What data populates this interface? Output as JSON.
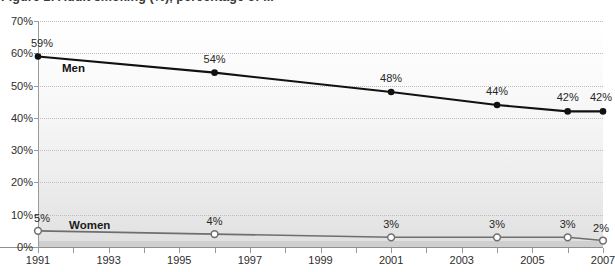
{
  "figure": {
    "title": "Figure 1: Adult smoking (%), percentage of ..."
  },
  "chart_data": {
    "type": "line",
    "title": "Figure 1: Adult smoking (%), percentage of ...",
    "xlabel": "",
    "ylabel": "",
    "x": [
      1991,
      1996,
      2001,
      2004,
      2006,
      2007
    ],
    "categories": [
      "1991",
      "1996",
      "2001",
      "2004",
      "2006",
      "2007"
    ],
    "xlim": [
      1991,
      2007
    ],
    "ylim": [
      0,
      70
    ],
    "yticks": [
      0,
      10,
      20,
      30,
      40,
      50,
      60,
      70
    ],
    "ytick_labels": [
      "0%",
      "10%",
      "20%",
      "30%",
      "40%",
      "50%",
      "60%",
      "70%"
    ],
    "xticks": [
      1991,
      1992,
      1993,
      1994,
      1995,
      1996,
      1997,
      1998,
      1999,
      2000,
      2001,
      2002,
      2003,
      2004,
      2005,
      2006,
      2007
    ],
    "xtick_labels_shown": [
      "1991",
      "1993",
      "1995",
      "1997",
      "1999",
      "2001",
      "2003",
      "2005",
      "2007"
    ],
    "grid": true,
    "grid_style": "dotted-horizontal",
    "legend_position": "inline-labels",
    "series": [
      {
        "name": "Men",
        "color": "#111111",
        "marker": "filled-circle",
        "values": [
          59,
          54,
          48,
          44,
          42,
          42
        ],
        "data_labels": [
          "59%",
          "54%",
          "48%",
          "44%",
          "42%",
          "42%"
        ]
      },
      {
        "name": "Women",
        "color": "#6e6e6e",
        "marker": "open-circle",
        "values": [
          5,
          4,
          3,
          3,
          3,
          2
        ],
        "data_labels": [
          "5%",
          "4%",
          "3%",
          "3%",
          "3%",
          "2%"
        ]
      }
    ]
  },
  "colors": {
    "men_line": "#111111",
    "women_line": "#6e6e6e",
    "gridline": "#bdbdbd",
    "axis": "#9a9a9a",
    "plot_top": "#ffffff",
    "plot_bottom": "#e0e0e0",
    "bottom_band": "#cfcfcf"
  }
}
